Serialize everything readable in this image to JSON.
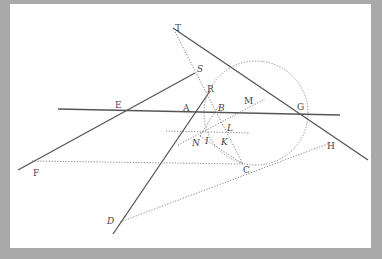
{
  "figure": {
    "background_color": "#a9a9a9",
    "panel_color": "#ffffff",
    "line_color": "#555555",
    "labels": [
      {
        "id": "T",
        "text": "T",
        "x": 177,
        "y": 31
      },
      {
        "id": "S",
        "text": "S",
        "x": 198,
        "y": 73
      },
      {
        "id": "R",
        "text": "R",
        "x": 209,
        "y": 92
      },
      {
        "id": "E",
        "text": "E",
        "x": 117,
        "y": 108
      },
      {
        "id": "A",
        "text": "A",
        "x": 185,
        "y": 110
      },
      {
        "id": "B",
        "text": "B",
        "x": 218,
        "y": 111
      },
      {
        "id": "M",
        "text": "M",
        "x": 245,
        "y": 104
      },
      {
        "id": "G",
        "text": "G",
        "x": 297,
        "y": 110
      },
      {
        "id": "L",
        "text": "L",
        "x": 227,
        "y": 131
      },
      {
        "id": "N",
        "text": "N",
        "x": 194,
        "y": 146
      },
      {
        "id": "I",
        "text": "I",
        "x": 206,
        "y": 144
      },
      {
        "id": "K",
        "text": "K",
        "x": 222,
        "y": 145
      },
      {
        "id": "H",
        "text": "H",
        "x": 329,
        "y": 149
      },
      {
        "id": "F",
        "text": "F",
        "x": 34,
        "y": 176
      },
      {
        "id": "C",
        "text": "C",
        "x": 243,
        "y": 173
      },
      {
        "id": "D",
        "text": "D",
        "x": 107,
        "y": 224
      }
    ]
  }
}
